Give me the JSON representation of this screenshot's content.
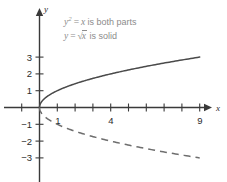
{
  "chart_data": {
    "type": "line",
    "title": "",
    "subtitle": "",
    "xlabel": "x",
    "ylabel": "y",
    "xlim": [
      -2,
      10.5
    ],
    "ylim": [
      -3.8,
      3.8
    ],
    "grid": false,
    "legend_position": "inside-top-left",
    "x_ticks": [
      -1,
      1,
      2,
      3,
      4,
      5,
      6,
      7,
      8,
      9
    ],
    "x_tick_labels": [
      "",
      "1",
      "",
      "",
      "4",
      "",
      "",
      "",
      "",
      "9"
    ],
    "y_ticks": [
      -3,
      -2,
      -1,
      1,
      2,
      3
    ],
    "y_tick_labels": [
      "−3",
      "−2",
      "−1",
      "1",
      "2",
      "3"
    ],
    "annotations": [
      {
        "id": "annotation-both-parts",
        "text": "y² = x is both parts",
        "lhs_var": "y",
        "lhs_exp": "2",
        "relation": "=",
        "rhs_var": "x",
        "tail": "is both parts"
      },
      {
        "id": "annotation-solid-branch",
        "text": "y = √x is solid",
        "lhs_var": "y",
        "relation": "=",
        "radical": "√",
        "radicand": "x",
        "tail": "is solid"
      }
    ],
    "series": [
      {
        "name": "y = sqrt(x)",
        "style": "solid",
        "color": "#4a4a4a",
        "x": [
          0,
          0.25,
          0.5,
          1,
          1.5,
          2,
          3,
          4,
          5,
          6,
          7,
          8,
          9
        ],
        "values": [
          0,
          0.5,
          0.707,
          1,
          1.225,
          1.414,
          1.732,
          2,
          2.236,
          2.449,
          2.646,
          2.828,
          3
        ]
      },
      {
        "name": "y = -sqrt(x)",
        "style": "dashed",
        "color": "#6e6e6e",
        "x": [
          0,
          0.25,
          0.5,
          1,
          1.5,
          2,
          3,
          4,
          5,
          6,
          7,
          8,
          9
        ],
        "values": [
          0,
          -0.5,
          -0.707,
          -1,
          -1.225,
          -1.414,
          -1.732,
          -2,
          -2.236,
          -2.449,
          -2.646,
          -2.828,
          -3
        ]
      }
    ],
    "axis_color": "#3a3a3a",
    "annotation_color": "#8c8c8c",
    "background": "#ffffff"
  },
  "axes": {
    "x_axis_name": "x",
    "y_axis_name": "y"
  }
}
